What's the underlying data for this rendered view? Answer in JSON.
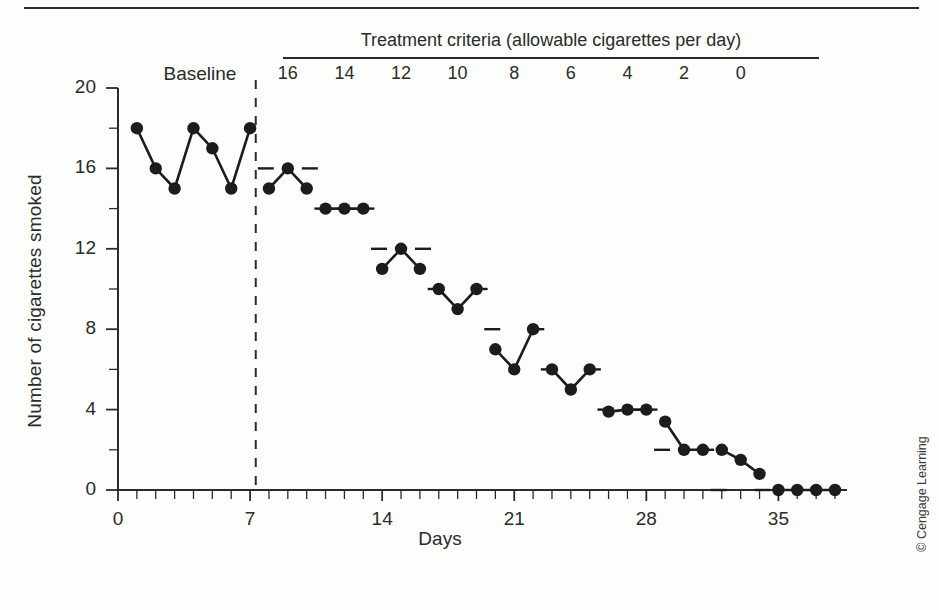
{
  "figure": {
    "credit": "© Cengage Learning",
    "criteria_header": "Treatment criteria (allowable cigarettes per day)",
    "baseline_label": "Baseline"
  },
  "chart_data": {
    "type": "line",
    "title": "",
    "xlabel": "Days",
    "ylabel": "Number of cigarettes smoked",
    "xlim": [
      0,
      38
    ],
    "ylim": [
      0,
      20
    ],
    "xticks": [
      0,
      7,
      14,
      21,
      28,
      35
    ],
    "xtick_labels": [
      "0",
      "7",
      "14",
      "21",
      "28",
      "35"
    ],
    "yticks": [
      0,
      4,
      8,
      12,
      16,
      20
    ],
    "ytick_labels": [
      "0",
      "4",
      "8",
      "12",
      "16",
      "20"
    ],
    "x_minor_tick_step": 1,
    "y_minor_tick_step": 2,
    "grid": false,
    "legend": false,
    "phase_line_x": 7.3,
    "phase_line_style": "dashed",
    "marker": "filled-circle",
    "series": [
      {
        "name": "Baseline",
        "x": [
          1,
          2,
          3,
          4,
          5,
          6,
          7
        ],
        "values": [
          18,
          16,
          15,
          18,
          17,
          15,
          18
        ]
      },
      {
        "name": "Criterion 16",
        "criterion": 16,
        "x": [
          8,
          9,
          10
        ],
        "values": [
          15,
          16,
          15
        ]
      },
      {
        "name": "Criterion 14",
        "criterion": 14,
        "x": [
          11,
          12,
          13
        ],
        "values": [
          14,
          14,
          14
        ]
      },
      {
        "name": "Criterion 12",
        "criterion": 12,
        "x": [
          14,
          15,
          16
        ],
        "values": [
          11,
          12,
          11
        ]
      },
      {
        "name": "Criterion 10",
        "criterion": 10,
        "x": [
          17,
          18,
          19
        ],
        "values": [
          10,
          9,
          10
        ]
      },
      {
        "name": "Criterion 8",
        "criterion": 8,
        "x": [
          20,
          21,
          22
        ],
        "values": [
          7,
          6,
          8
        ]
      },
      {
        "name": "Criterion 6",
        "criterion": 6,
        "x": [
          23,
          24,
          25
        ],
        "values": [
          6,
          5,
          6
        ]
      },
      {
        "name": "Criterion 4",
        "criterion": 4,
        "x": [
          26,
          27,
          28
        ],
        "values": [
          3.9,
          4,
          4
        ]
      },
      {
        "name": "Criterion 2",
        "criterion": 2,
        "x": [
          29,
          30,
          31
        ],
        "values": [
          3.4,
          2,
          2
        ]
      },
      {
        "name": "Criterion 0 descent",
        "criterion": 0,
        "x": [
          32,
          33,
          34
        ],
        "values": [
          2,
          1.5,
          0.8
        ]
      },
      {
        "name": "Criterion 0 zero",
        "criterion": 0,
        "x": [
          35,
          36,
          37,
          38
        ],
        "values": [
          0,
          0,
          0,
          0
        ]
      }
    ],
    "criterion_markers": [
      {
        "label": "16",
        "x": 9,
        "value": 16
      },
      {
        "label": "14",
        "x": 12,
        "value": 14
      },
      {
        "label": "12",
        "x": 15,
        "value": 12
      },
      {
        "label": "10",
        "x": 18,
        "value": 10
      },
      {
        "label": "8",
        "x": 21,
        "value": 8
      },
      {
        "label": "6",
        "x": 24,
        "value": 6
      },
      {
        "label": "4",
        "x": 27,
        "value": 4
      },
      {
        "label": "2",
        "x": 30,
        "value": 2
      },
      {
        "label": "0",
        "x": 33,
        "value": 0
      }
    ],
    "criteria_labels": [
      "16",
      "14",
      "12",
      "10",
      "8",
      "6",
      "4",
      "2",
      "0"
    ],
    "colors": {
      "line": "#1c1c1c",
      "marker": "#1c1c1c",
      "axis": "#2b2b2b",
      "background": "#fdfdfc"
    }
  }
}
